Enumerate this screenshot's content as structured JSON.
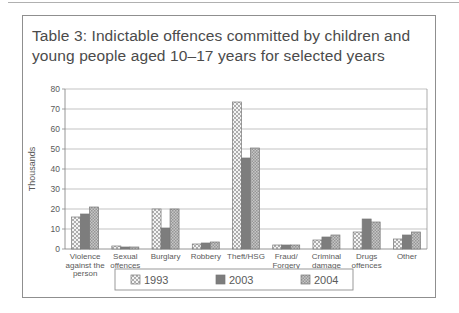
{
  "figure": {
    "title_line1": "Table 3:  Indictable offences committed by children and",
    "title_line2": "young people aged 10–17 years for selected years"
  },
  "colors": {
    "figure_border": "#8f8f8f",
    "top_rule": "#b0b0b0",
    "title_text": "#4b4b4b",
    "axis_text": "#5a5a5a",
    "gridline": "#9a9a9a",
    "plot_border": "#8a8a8a",
    "bar_outline": "#787878",
    "series_1993_hatch": "#a6a6a6",
    "series_1993_bg": "#f4f4f4",
    "series_2003_fill": "#7d7d7d",
    "series_2004_light": "#c6c6c6",
    "series_2004_dark": "#969696",
    "legend_border": "#8f8f8f"
  },
  "chart_data": {
    "type": "bar",
    "title": "Table 3: Indictable offences committed by children and young people aged 10–17 years for selected years",
    "xlabel": "",
    "ylabel": "Thousands",
    "ylim": [
      0,
      80
    ],
    "yticks": [
      0,
      10,
      20,
      30,
      40,
      50,
      60,
      70,
      80
    ],
    "grid": true,
    "legend_position": "bottom",
    "categories": [
      "Violence against the person",
      "Sexual offences",
      "Burglary",
      "Robbery",
      "Theft/HSG",
      "Fraud/Forgery",
      "Criminal damage",
      "Drugs offences",
      "Other"
    ],
    "category_label_lines": [
      [
        "Violence",
        "against the",
        "person"
      ],
      [
        "Sexual",
        "offences"
      ],
      [
        "Burglary"
      ],
      [
        "Robbery"
      ],
      [
        "Theft/HSG"
      ],
      [
        "Fraud/",
        "Forgery"
      ],
      [
        "Criminal",
        "damage"
      ],
      [
        "Drugs",
        "offences"
      ],
      [
        "Other"
      ]
    ],
    "series": [
      {
        "name": "1993",
        "pattern": "diagonal-crosshatch",
        "values": [
          16,
          1.5,
          20,
          2.5,
          73.5,
          2,
          4.5,
          8.5,
          5
        ]
      },
      {
        "name": "2003",
        "pattern": "solid",
        "values": [
          17.5,
          1,
          10.5,
          3,
          45.5,
          2,
          6,
          15,
          7
        ]
      },
      {
        "name": "2004",
        "pattern": "checker",
        "values": [
          21,
          1,
          20,
          3.5,
          50.5,
          2,
          7,
          13.5,
          8.5
        ]
      }
    ]
  }
}
